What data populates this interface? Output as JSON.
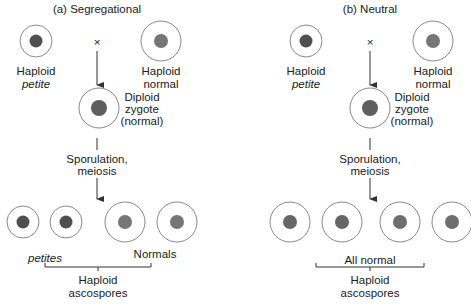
{
  "colors": {
    "cell_outline": "#8a8a8a",
    "petite_nucleus": "#4f4f4f",
    "normal_nucleus": "#767676",
    "text": "#222222",
    "line": "#333333"
  },
  "panels": [
    {
      "id": "a",
      "title": "(a) Segregational",
      "cross_symbol": "×",
      "parents": [
        {
          "label_line1": "Haploid",
          "label_line2": "petite",
          "line2_italic": true,
          "type": "petite"
        },
        {
          "label_line1": "Haploid",
          "label_line2": "normal",
          "line2_italic": false,
          "type": "normal"
        }
      ],
      "zygote": {
        "label_line1": "Diploid",
        "label_line2": "zygote",
        "label_line3": "(normal)",
        "type": "normal"
      },
      "process": {
        "line1": "Sporulation,",
        "line2": "meiosis"
      },
      "ascospores": [
        "petite",
        "petite",
        "normal",
        "normal"
      ],
      "group_labels": {
        "left": "petites",
        "right": "Normals"
      },
      "bracket_label": {
        "line1": "Haploid",
        "line2": "ascospores"
      }
    },
    {
      "id": "b",
      "title": "(b) Neutral",
      "cross_symbol": "×",
      "parents": [
        {
          "label_line1": "Haploid",
          "label_line2": "petite",
          "line2_italic": true,
          "type": "petite"
        },
        {
          "label_line1": "Haploid",
          "label_line2": "normal",
          "line2_italic": false,
          "type": "normal"
        }
      ],
      "zygote": {
        "label_line1": "Diploid",
        "label_line2": "zygote",
        "label_line3": "(normal)",
        "type": "normal"
      },
      "process": {
        "line1": "Sporulation,",
        "line2": "meiosis"
      },
      "ascospores": [
        "normal",
        "normal",
        "normal",
        "normal"
      ],
      "group_labels": {
        "center": "All normal"
      },
      "bracket_label": {
        "line1": "Haploid",
        "line2": "ascospores"
      }
    }
  ]
}
